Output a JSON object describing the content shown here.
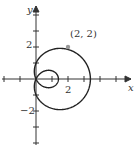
{
  "chart_data": {
    "type": "line",
    "curve": {
      "equation_estimate": "r = 1 + 2.4cos(theta)",
      "a": 1,
      "b": 2.4
    },
    "xlabel": "x",
    "ylabel": "y",
    "xticks": [
      -2,
      -1,
      0,
      1,
      2,
      3,
      4,
      5
    ],
    "yticks": [
      -4,
      -3,
      -2,
      -1,
      0,
      1,
      2,
      3,
      4
    ],
    "x_tick_labels": [
      "2"
    ],
    "y_tick_labels": [
      "2",
      "−2"
    ],
    "xlim": [
      -2.2,
      5.8
    ],
    "ylim": [
      -4.2,
      5
    ],
    "annotations": [
      {
        "text": "(2, 2)",
        "x": 2,
        "y": 2
      }
    ],
    "grid": false
  },
  "labels": {
    "x_axis": "x",
    "y_axis": "y",
    "x2": "2",
    "y2": "2",
    "ym2": "−2",
    "point": "(2, 2)"
  }
}
